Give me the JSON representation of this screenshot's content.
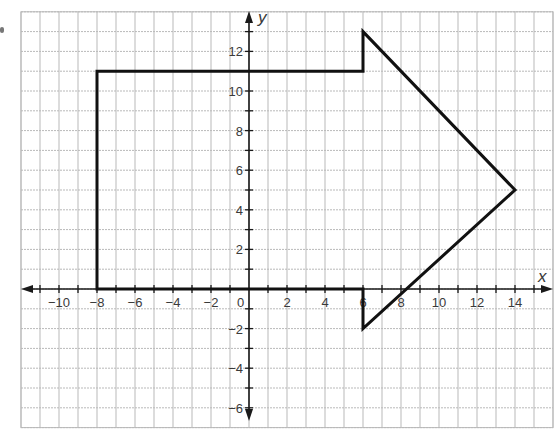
{
  "chart_data": {
    "type": "polygon-on-coordinate-grid",
    "title": "",
    "xlabel": "x",
    "ylabel": "y",
    "grid": true,
    "grid_x_range": [
      -12,
      16
    ],
    "grid_y_range": [
      -7,
      14
    ],
    "x_ticks": [
      -10,
      -8,
      -6,
      -4,
      -2,
      0,
      2,
      4,
      6,
      8,
      10,
      12,
      14
    ],
    "y_ticks": [
      -6,
      -4,
      -2,
      2,
      4,
      6,
      8,
      10,
      12
    ],
    "origin_label": "0",
    "shape": {
      "name": "arrow",
      "vertices": [
        [
          -8,
          0
        ],
        [
          -8,
          11
        ],
        [
          6,
          11
        ],
        [
          6,
          13
        ],
        [
          14,
          5
        ],
        [
          6,
          -2
        ],
        [
          6,
          0
        ]
      ]
    }
  },
  "labels": {
    "x_axis": "x",
    "y_axis": "y",
    "origin": "0"
  },
  "colors": {
    "grid": "#b9b9b9",
    "axis": "#1a1a1a",
    "shape": "#111111",
    "text": "#3a3a3a"
  }
}
